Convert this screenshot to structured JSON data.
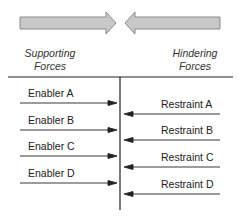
{
  "diagram": {
    "type": "force-field-analysis",
    "headers": {
      "left": "Supporting Forces",
      "left_line1": "Supporting",
      "left_line2": "Forces",
      "right": "Hindering Forces",
      "right_line1": "Hindering",
      "right_line2": "Forces"
    },
    "enablers": [
      {
        "label": "Enabler A"
      },
      {
        "label": "Enabler B"
      },
      {
        "label": "Enabler C"
      },
      {
        "label": "Enabler D"
      }
    ],
    "restraints": [
      {
        "label": "Restraint A"
      },
      {
        "label": "Restraint B"
      },
      {
        "label": "Restraint C"
      },
      {
        "label": "Restraint D"
      }
    ],
    "colors": {
      "big_arrow_fill": "#c8c8c8",
      "big_arrow_stroke": "#8a8a8a",
      "line": "#222222"
    }
  }
}
